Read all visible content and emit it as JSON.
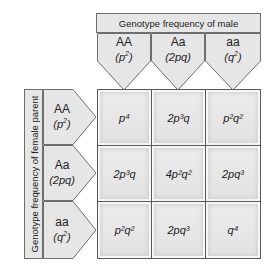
{
  "male_header": "Genotype frequency of male",
  "female_header": "Genotype frequency of female parent",
  "male_genotypes": [
    {
      "genotype": "AA",
      "freq_base": "(p",
      "freq_exp": "2",
      "freq_end": ")"
    },
    {
      "genotype": "Aa",
      "freq_base": "(2pq)",
      "freq_exp": "",
      "freq_end": ""
    },
    {
      "genotype": "aa",
      "freq_base": "(q",
      "freq_exp": "2",
      "freq_end": ")"
    }
  ],
  "female_genotypes": [
    {
      "genotype": "AA",
      "freq_base": "(p",
      "freq_exp": "2",
      "freq_end": ")"
    },
    {
      "genotype": "Aa",
      "freq_base": "(2pq)",
      "freq_exp": "",
      "freq_end": ""
    },
    {
      "genotype": "aa",
      "freq_base": "(q",
      "freq_exp": "2",
      "freq_end": ")"
    }
  ],
  "matrix": [
    [
      "p⁴",
      "2p³q",
      "p²q²"
    ],
    [
      "2p³q",
      "4p²q²",
      "2pq³"
    ],
    [
      "p²q²",
      "2pq³",
      "q⁴"
    ]
  ],
  "colors": {
    "box_fill": "#e6e6e6",
    "border": "#5a5a5a",
    "background": "#ffffff"
  }
}
